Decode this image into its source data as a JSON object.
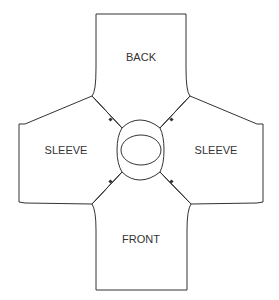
{
  "diagram": {
    "type": "sewing-pattern-layout",
    "pieces": [
      {
        "id": "back",
        "label": "BACK"
      },
      {
        "id": "sleeve-left",
        "label": "SLEEVE"
      },
      {
        "id": "sleeve-right",
        "label": "SLEEVE"
      },
      {
        "id": "front",
        "label": "FRONT"
      }
    ],
    "center_opening": "neck-opening",
    "seams": [
      "back-left-sleeve",
      "back-right-sleeve",
      "front-left-sleeve",
      "front-right-sleeve"
    ],
    "colors": {
      "stroke": "#333333",
      "background": "#ffffff"
    }
  }
}
